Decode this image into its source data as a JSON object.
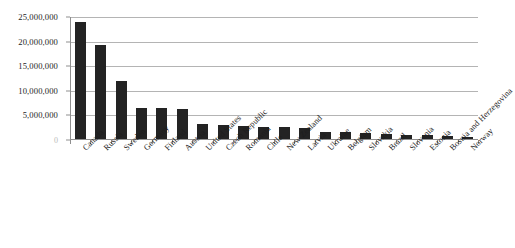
{
  "chart_data": {
    "type": "bar",
    "title": "",
    "subtitle": "",
    "xlabel": "",
    "ylabel": "",
    "ylim": [
      0,
      25000000
    ],
    "grid": true,
    "legend": false,
    "legend_position": "none",
    "orientation": "vertical",
    "bar_color": "#232323",
    "gridline_color": "#b4b4b4",
    "axis_color": "#8f8f8f",
    "y_ticks": [
      0,
      5000000,
      10000000,
      15000000,
      20000000,
      25000000
    ],
    "y_tick_labels": [
      "0",
      "5,000,000",
      "10,000,000",
      "15,000,000",
      "20,000,000",
      "25,000,000"
    ],
    "categories": [
      "Canada",
      "Russia",
      "Sweden",
      "Germany",
      "Finland",
      "Austria",
      "United States",
      "Czech Republic",
      "Romania",
      "Chile",
      "New Zealand",
      "Latvia",
      "Ukraine",
      "Belgium",
      "Slovakia",
      "Brazil",
      "Slovenia",
      "Estonia",
      "Bosnia and Herzegovina",
      "Norway"
    ],
    "values": [
      23800000,
      19100000,
      11800000,
      6400000,
      6300000,
      6100000,
      3000000,
      2800000,
      2600000,
      2500000,
      2400000,
      2200000,
      1500000,
      1500000,
      1300000,
      1100000,
      900000,
      800000,
      700000,
      400000
    ]
  }
}
